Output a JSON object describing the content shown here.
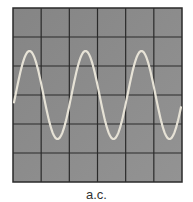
{
  "diagram": {
    "caption": "a.c.",
    "screen": {
      "x": 13,
      "y": 8,
      "width": 169,
      "height": 174,
      "columns": 6,
      "rows": 6
    },
    "colors": {
      "screen": "#8a8a8a",
      "grid": "#2a2a2a",
      "trace": "#e6e2d6",
      "border": "#2a2a2a"
    },
    "trace": {
      "type": "sine",
      "cycles": 3,
      "midline_y": 95,
      "amplitude_px": 44,
      "period_px": 56,
      "start_x": 14,
      "end_x": 181,
      "phase_offset_px": -1
    }
  }
}
